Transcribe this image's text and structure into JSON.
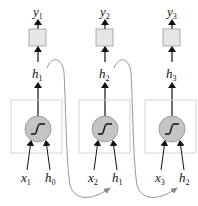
{
  "diagram": {
    "type": "unrolled recurrent neural network",
    "colors": {
      "box_stroke": "#cfcfcf",
      "output_fill": "#e6e6e6",
      "output_stroke": "#9a9a9a",
      "neuron_fill": "#c4c4c4",
      "neuron_stroke": "#8f8f8f",
      "arrow": "#111111",
      "recurrent_curve": "#8a8a8a"
    },
    "steps": [
      {
        "output": {
          "base": "y",
          "sub": "1"
        },
        "hidden": {
          "base": "h",
          "sub": "1"
        },
        "input_x": {
          "base": "x",
          "sub": "1"
        },
        "input_h": {
          "base": "h",
          "sub": "0"
        }
      },
      {
        "output": {
          "base": "y",
          "sub": "2"
        },
        "hidden": {
          "base": "h",
          "sub": "2"
        },
        "input_x": {
          "base": "x",
          "sub": "2"
        },
        "input_h": {
          "base": "h",
          "sub": "1"
        }
      },
      {
        "output": {
          "base": "y",
          "sub": "3"
        },
        "hidden": {
          "base": "h",
          "sub": "3"
        },
        "input_x": {
          "base": "x",
          "sub": "3"
        },
        "input_h": {
          "base": "h",
          "sub": "2"
        }
      }
    ],
    "recurrent_connections": [
      {
        "from": "h1",
        "to": "h1 (step 2 input)"
      },
      {
        "from": "h2",
        "to": "h2 (step 3 input)"
      }
    ],
    "icons": {
      "activation": "sigmoid-icon"
    }
  }
}
